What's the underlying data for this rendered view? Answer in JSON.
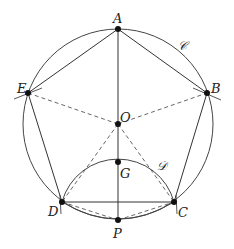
{
  "diagram": {
    "type": "geometric-construction",
    "colors": {
      "stroke": "#333333",
      "point": "#111111",
      "background": "#ffffff"
    },
    "points": [
      {
        "id": "A",
        "label": "A",
        "x": 118,
        "y": 29
      },
      {
        "id": "B",
        "label": "B",
        "x": 207,
        "y": 93
      },
      {
        "id": "C",
        "label": "C",
        "x": 174,
        "y": 202
      },
      {
        "id": "D",
        "label": "D",
        "x": 62,
        "y": 202
      },
      {
        "id": "E",
        "label": "E",
        "x": 28,
        "y": 93
      },
      {
        "id": "O",
        "label": "O",
        "x": 118,
        "y": 124
      },
      {
        "id": "G",
        "label": "G",
        "x": 118,
        "y": 162
      },
      {
        "id": "P",
        "label": "P",
        "x": 118,
        "y": 220
      }
    ],
    "circles": [
      {
        "id": "circle-C",
        "label": "𝒞",
        "center": "O",
        "radius": 95
      },
      {
        "id": "arc-D",
        "label": "𝒟",
        "center": "P",
        "radius": 58,
        "from": "D",
        "to": "C",
        "through": "G"
      }
    ],
    "solid_segments": [
      [
        "A",
        "B"
      ],
      [
        "B",
        "C"
      ],
      [
        "C",
        "D"
      ],
      [
        "D",
        "E"
      ],
      [
        "E",
        "A"
      ],
      [
        "A",
        "P"
      ]
    ],
    "dashed_segments": [
      [
        "O",
        "E"
      ],
      [
        "O",
        "B"
      ],
      [
        "O",
        "D"
      ],
      [
        "O",
        "C"
      ],
      [
        "D",
        "P"
      ],
      [
        "P",
        "C"
      ]
    ],
    "labels": {
      "A": "A",
      "B": "B",
      "C": "C",
      "D": "D",
      "E": "E",
      "O": "O",
      "G": "G",
      "P": "P",
      "circle_main": "𝒞",
      "circle_small": "𝒟"
    }
  }
}
